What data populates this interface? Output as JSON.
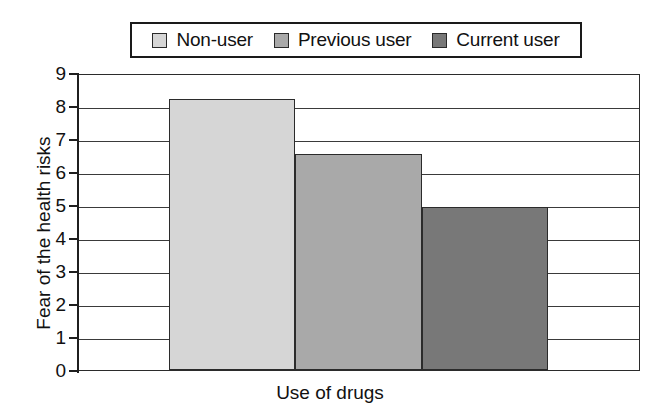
{
  "chart_data": {
    "type": "bar",
    "title": "",
    "subtitle": "",
    "xlabel": "Use of drugs",
    "ylabel": "Fear of the health risks",
    "categories": [
      "Non-user",
      "Previous user",
      "Current user"
    ],
    "values": [
      8.2,
      6.55,
      4.95
    ],
    "series": [
      {
        "name": "Fear of the health risks",
        "values": [
          8.2,
          6.55,
          4.95
        ]
      }
    ],
    "ylim": [
      0,
      9
    ],
    "ytick_labels": [
      "0",
      "1",
      "2",
      "3",
      "4",
      "5",
      "6",
      "7",
      "8",
      "9"
    ],
    "ytick_values": [
      0,
      1,
      2,
      3,
      4,
      5,
      6,
      7,
      8,
      9
    ],
    "xtick_labels": [],
    "grid": true,
    "grid_axis": "y",
    "legend_position": "top",
    "bar_colors": [
      "#d6d6d6",
      "#a9a9a9",
      "#787878"
    ],
    "bar_border_color": "#2b2b2b",
    "axis_color": "#1f1f1f",
    "gridline_color": "#3a3a3a",
    "background_color": "#ffffff",
    "text_color": "#111111"
  },
  "legend": {
    "items": [
      {
        "label": "Non-user",
        "color": "#d6d6d6"
      },
      {
        "label": "Previous user",
        "color": "#a9a9a9"
      },
      {
        "label": "Current user",
        "color": "#787878"
      }
    ]
  },
  "axes": {
    "x_title": "Use of drugs",
    "y_title": "Fear of the health risks",
    "y_ticks": [
      "9",
      "8",
      "7",
      "6",
      "5",
      "4",
      "3",
      "2",
      "1",
      "0"
    ]
  }
}
